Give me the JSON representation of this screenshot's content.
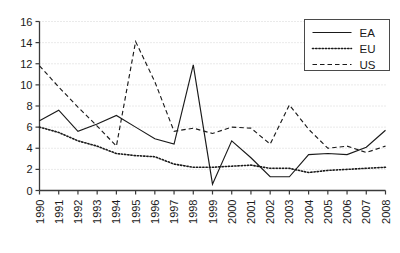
{
  "chart_data": {
    "type": "line",
    "title": "",
    "subtitle": "",
    "xlabel": "",
    "ylabel": "",
    "grid": true,
    "grid_style": "dotted-horizontal",
    "legend_position": "top-right",
    "xlim": [
      1990,
      2008
    ],
    "ylim": [
      0,
      16
    ],
    "ytick_step": 2,
    "yticks": [
      0,
      2,
      4,
      6,
      8,
      10,
      12,
      14,
      16
    ],
    "ytick_labels": [
      "0",
      "2",
      "4",
      "6",
      "8",
      "10",
      "12",
      "14",
      "16"
    ],
    "categories": [
      1990,
      1991,
      1992,
      1993,
      1994,
      1995,
      1996,
      1997,
      1998,
      1999,
      2000,
      2001,
      2002,
      2003,
      2004,
      2005,
      2006,
      2007,
      2008
    ],
    "xtick_labels": [
      "1990",
      "1991",
      "1992",
      "1993",
      "1994",
      "1995",
      "1996",
      "1997",
      "1998",
      "1999",
      "2000",
      "2001",
      "2002",
      "2003",
      "2004",
      "2005",
      "2006",
      "2007",
      "2008"
    ],
    "series": [
      {
        "name": "EA",
        "style": "solid",
        "color": "#1a1a1a",
        "values": [
          6.6,
          7.6,
          5.6,
          6.3,
          7.1,
          6.0,
          4.9,
          4.4,
          11.9,
          0.6,
          4.7,
          3.1,
          1.3,
          1.3,
          3.4,
          3.5,
          3.4,
          4.1,
          5.7
        ]
      },
      {
        "name": "EU",
        "style": "dotted",
        "color": "#1a1a1a",
        "values": [
          6.0,
          5.5,
          4.7,
          4.2,
          3.5,
          3.3,
          3.2,
          2.5,
          2.2,
          2.2,
          2.3,
          2.4,
          2.1,
          2.1,
          1.7,
          1.9,
          2.0,
          2.1,
          2.2
        ]
      },
      {
        "name": "US",
        "style": "dashed",
        "color": "#1a1a1a",
        "values": [
          11.8,
          9.8,
          7.9,
          6.1,
          4.2,
          14.1,
          10.3,
          5.6,
          5.9,
          5.4,
          6.0,
          5.9,
          4.4,
          8.1,
          5.8,
          4.0,
          4.2,
          3.6,
          4.2
        ]
      }
    ],
    "legend": [
      {
        "label": "EA",
        "style": "solid"
      },
      {
        "label": "EU",
        "style": "dotted"
      },
      {
        "label": "US",
        "style": "dashed"
      }
    ]
  }
}
